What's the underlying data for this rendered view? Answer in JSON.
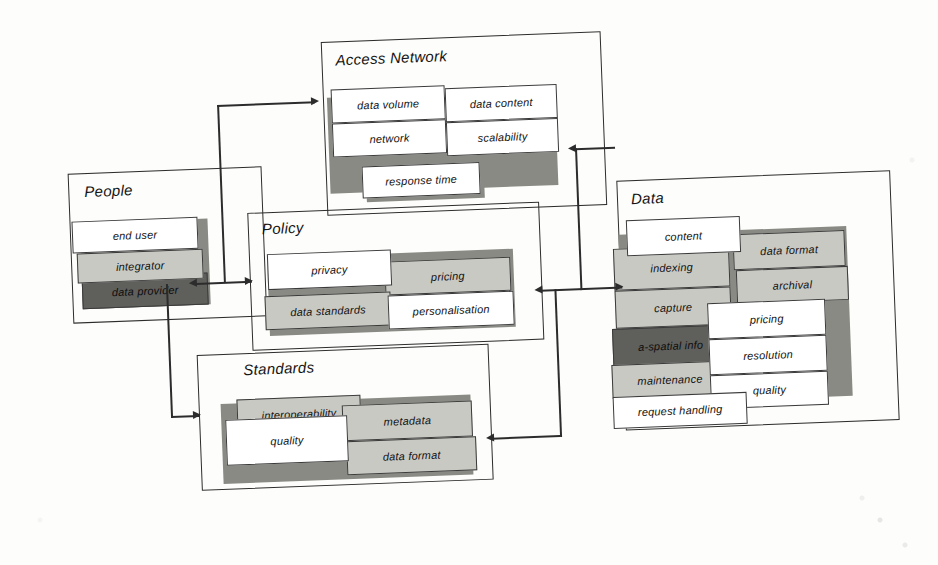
{
  "diagram": {
    "type": "block-diagram",
    "title": "",
    "style": "scanned monochrome figure, slight rotation",
    "groups": [
      {
        "id": "people",
        "title": "People",
        "cells": [
          {
            "label": "end user",
            "shade": "white"
          },
          {
            "label": "integrator",
            "shade": "light-gray"
          },
          {
            "label": "data provider",
            "shade": "dark-gray"
          }
        ]
      },
      {
        "id": "access-network",
        "title": "Access Network",
        "cells": [
          {
            "label": "data volume",
            "shade": "white"
          },
          {
            "label": "data content",
            "shade": "white"
          },
          {
            "label": "network",
            "shade": "white"
          },
          {
            "label": "scalability",
            "shade": "white"
          },
          {
            "label": "response time",
            "shade": "white"
          }
        ]
      },
      {
        "id": "policy",
        "title": "Policy",
        "cells": [
          {
            "label": "privacy",
            "shade": "white"
          },
          {
            "label": "pricing",
            "shade": "light-gray"
          },
          {
            "label": "data standards",
            "shade": "light-gray"
          },
          {
            "label": "personalisation",
            "shade": "white"
          }
        ]
      },
      {
        "id": "standards",
        "title": "Standards",
        "cells": [
          {
            "label": "interoperability",
            "shade": "light-gray"
          },
          {
            "label": "metadata",
            "shade": "light-gray"
          },
          {
            "label": "quality",
            "shade": "white"
          },
          {
            "label": "data format",
            "shade": "light-gray"
          }
        ]
      },
      {
        "id": "data",
        "title": "Data",
        "cells": [
          {
            "label": "content",
            "shade": "white"
          },
          {
            "label": "data format",
            "shade": "light-gray"
          },
          {
            "label": "indexing",
            "shade": "light-gray"
          },
          {
            "label": "archival",
            "shade": "light-gray"
          },
          {
            "label": "capture",
            "shade": "light-gray"
          },
          {
            "label": "pricing",
            "shade": "white"
          },
          {
            "label": "a-spatial info",
            "shade": "dark-gray"
          },
          {
            "label": "resolution",
            "shade": "white"
          },
          {
            "label": "maintenance",
            "shade": "light-gray"
          },
          {
            "label": "quality",
            "shade": "white"
          },
          {
            "label": "request handling",
            "shade": "white"
          }
        ]
      }
    ],
    "connectors": [
      {
        "from": "people",
        "to": "policy",
        "arrows": "both"
      },
      {
        "from": "policy",
        "to": "data",
        "arrows": "both"
      },
      {
        "from": "people",
        "to": "access-network",
        "arrows": "to"
      },
      {
        "from": "data",
        "to": "access-network",
        "arrows": "to"
      },
      {
        "from": "people",
        "to": "standards",
        "arrows": "to"
      },
      {
        "from": "data",
        "to": "standards",
        "arrows": "to"
      }
    ],
    "colors": {
      "ink": "#2c2c2c",
      "paper": "#fdfdfb",
      "light_gray": "#c9c9c4",
      "dark_gray": "#5f5f5c",
      "white": "#ffffff"
    }
  }
}
